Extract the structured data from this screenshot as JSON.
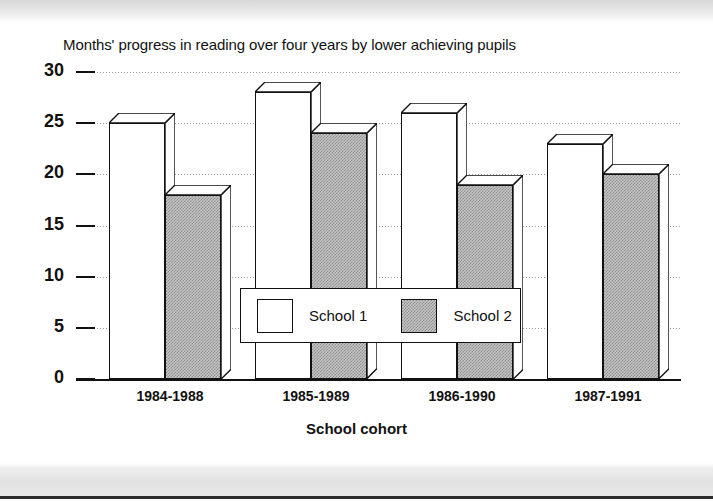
{
  "chart_data": {
    "type": "bar",
    "title": "Months' progress in reading over four years by lower achieving pupils",
    "xlabel": "School cohort",
    "ylabel": "",
    "categories": [
      "1984-1988",
      "1985-1989",
      "1986-1990",
      "1987-1991"
    ],
    "series": [
      {
        "name": "School 1",
        "values": [
          25,
          28,
          26,
          23
        ],
        "color": "#ffffff"
      },
      {
        "name": "School 2",
        "values": [
          18,
          24,
          19,
          20
        ],
        "color": "#c6c6c6"
      }
    ],
    "ylim": [
      0,
      30
    ],
    "yticks": [
      0,
      5,
      10,
      15,
      20,
      25,
      30
    ],
    "ytick_labels": [
      "0",
      "5",
      "10",
      "15",
      "20",
      "25",
      "30"
    ],
    "grid": true,
    "grid_axis": "y",
    "legend_position": "center",
    "style": "3d-blocks"
  },
  "legend": {
    "items": [
      {
        "label": "School 1",
        "swatch": "white-swatch"
      },
      {
        "label": "School 2",
        "swatch": "grey-hatched-swatch"
      }
    ]
  }
}
